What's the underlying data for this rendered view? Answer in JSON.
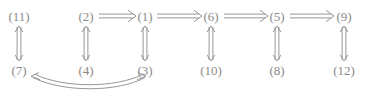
{
  "diagram": {
    "background_color": "#ffffff",
    "stroke_color": "#8a8a8a",
    "text_color": "#8a8a8a",
    "nodes": [
      {
        "id": "n11",
        "label": "(11)",
        "x": 19,
        "y": 16,
        "row": "top"
      },
      {
        "id": "n2",
        "label": "(2)",
        "x": 86,
        "y": 16,
        "row": "top"
      },
      {
        "id": "n1",
        "label": "(1)",
        "x": 145,
        "y": 16,
        "row": "top"
      },
      {
        "id": "n6",
        "label": "(6)",
        "x": 211,
        "y": 16,
        "row": "top"
      },
      {
        "id": "n5",
        "label": "(5)",
        "x": 277,
        "y": 16,
        "row": "top"
      },
      {
        "id": "n9",
        "label": "(9)",
        "x": 344,
        "y": 16,
        "row": "top"
      },
      {
        "id": "n7",
        "label": "(7)",
        "x": 19,
        "y": 70,
        "row": "bottom"
      },
      {
        "id": "n4",
        "label": "(4)",
        "x": 86,
        "y": 70,
        "row": "bottom"
      },
      {
        "id": "n3",
        "label": "(3)",
        "x": 145,
        "y": 70,
        "row": "bottom"
      },
      {
        "id": "n10",
        "label": "(10)",
        "x": 211,
        "y": 70,
        "row": "bottom"
      },
      {
        "id": "n8",
        "label": "(8)",
        "x": 277,
        "y": 70,
        "row": "bottom"
      },
      {
        "id": "n12",
        "label": "(12)",
        "x": 344,
        "y": 70,
        "row": "bottom"
      }
    ],
    "edges": [
      {
        "id": "e-2-1",
        "from": "(2)",
        "to": "(1)",
        "kind": "horizontal",
        "style": "double-line",
        "direction": "forward"
      },
      {
        "id": "e-1-6",
        "from": "(1)",
        "to": "(6)",
        "kind": "horizontal",
        "style": "double-line",
        "direction": "forward"
      },
      {
        "id": "e-6-5",
        "from": "(6)",
        "to": "(5)",
        "kind": "horizontal",
        "style": "double-line",
        "direction": "forward"
      },
      {
        "id": "e-5-9",
        "from": "(5)",
        "to": "(9)",
        "kind": "horizontal",
        "style": "double-line",
        "direction": "forward"
      },
      {
        "id": "e-11-7",
        "from": "(11)",
        "to": "(7)",
        "kind": "vertical",
        "style": "double-line",
        "direction": "bidirectional"
      },
      {
        "id": "e-2-4",
        "from": "(2)",
        "to": "(4)",
        "kind": "vertical",
        "style": "double-line",
        "direction": "bidirectional"
      },
      {
        "id": "e-1-3",
        "from": "(1)",
        "to": "(3)",
        "kind": "vertical",
        "style": "double-line",
        "direction": "bidirectional"
      },
      {
        "id": "e-6-10",
        "from": "(6)",
        "to": "(10)",
        "kind": "vertical",
        "style": "double-line",
        "direction": "bidirectional"
      },
      {
        "id": "e-5-8",
        "from": "(5)",
        "to": "(8)",
        "kind": "vertical",
        "style": "double-line",
        "direction": "bidirectional"
      },
      {
        "id": "e-9-12",
        "from": "(9)",
        "to": "(12)",
        "kind": "vertical",
        "style": "double-line",
        "direction": "bidirectional"
      },
      {
        "id": "e-7-3",
        "from": "(7)",
        "to": "(3)",
        "kind": "curved",
        "style": "double-line",
        "direction": "bidirectional"
      }
    ]
  }
}
